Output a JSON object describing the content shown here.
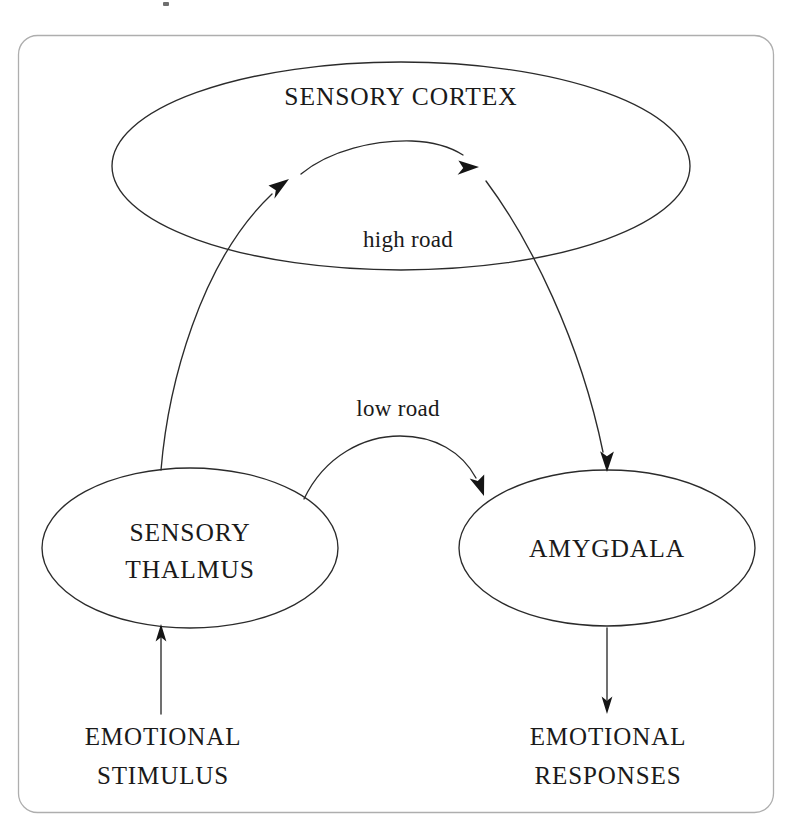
{
  "figure": {
    "frame": {
      "name": "figure-border",
      "stroke_color": "#aeaeae"
    },
    "ink_color": "#1a1a1a",
    "background_color": "#ffffff"
  },
  "nodes": [
    {
      "id": "sensory-cortex",
      "label": "SENSORY CORTEX",
      "shape": "ellipse",
      "cx": 401,
      "cy": 166,
      "rx": 289,
      "ry": 104,
      "label_x": 401,
      "label_y": 105
    },
    {
      "id": "sensory-thalmus",
      "label_line1": "SENSORY",
      "label_line2": "THALMUS",
      "shape": "ellipse",
      "cx": 190,
      "cy": 548,
      "rx": 148,
      "ry": 80,
      "label_x": 190,
      "label_y": 541
    },
    {
      "id": "amygdala",
      "label": "AMYGDALA",
      "shape": "ellipse",
      "cx": 607,
      "cy": 548,
      "rx": 148,
      "ry": 78,
      "label_x": 607,
      "label_y": 557
    }
  ],
  "edge_labels": [
    {
      "id": "high-road",
      "text": "high road",
      "x": 408,
      "y": 247
    },
    {
      "id": "low-road",
      "text": "low road",
      "x": 398,
      "y": 416
    }
  ],
  "io_labels": [
    {
      "id": "emotional-stimulus",
      "line1": "EMOTIONAL",
      "line2": "STIMULUS",
      "x": 163,
      "y1": 745,
      "y2": 784
    },
    {
      "id": "emotional-responses",
      "line1": "EMOTIONAL",
      "line2": "RESPONSES",
      "x": 608,
      "y1": 745,
      "y2": 784
    }
  ],
  "edges": [
    {
      "id": "stimulus-to-thalmus",
      "from": "emotional-stimulus",
      "to": "sensory-thalmus",
      "kind": "straight-arrow"
    },
    {
      "id": "thalmus-to-cortex",
      "from": "sensory-thalmus",
      "to": "sensory-cortex",
      "kind": "curved-arrow",
      "pathway": "high road"
    },
    {
      "id": "cortex-internal-arc",
      "from": "sensory-cortex",
      "to": "sensory-cortex",
      "kind": "curved-arrow",
      "pathway": "high road"
    },
    {
      "id": "cortex-to-amygdala",
      "from": "sensory-cortex",
      "to": "amygdala",
      "kind": "curved-arrow",
      "pathway": "high road"
    },
    {
      "id": "thalmus-to-amygdala",
      "from": "sensory-thalmus",
      "to": "amygdala",
      "kind": "curved-arrow",
      "pathway": "low road"
    },
    {
      "id": "amygdala-to-responses",
      "from": "amygdala",
      "to": "emotional-responses",
      "kind": "straight-arrow"
    }
  ]
}
